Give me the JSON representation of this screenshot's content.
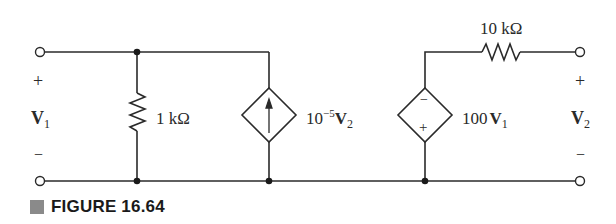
{
  "figure": {
    "caption": "FIGURE 16.64"
  },
  "circuit": {
    "port1": {
      "voltage_label": "V",
      "voltage_sub": "1",
      "plus": "+",
      "minus": "−"
    },
    "port2": {
      "voltage_label": "V",
      "voltage_sub": "2",
      "plus": "+",
      "minus": "−"
    },
    "shunt_resistor": {
      "value": "1 kΩ"
    },
    "current_source": {
      "coef_base": "10",
      "coef_exp": "−5",
      "var": "V",
      "var_sub": "2"
    },
    "voltage_source": {
      "coef": "100",
      "var": "V",
      "var_sub": "1",
      "top_sign": "−",
      "bottom_sign": "+"
    },
    "series_resistor": {
      "value": "10 kΩ"
    }
  },
  "colors": {
    "wire": "#2a2a2a",
    "caption_square": "#8a8a8a"
  }
}
